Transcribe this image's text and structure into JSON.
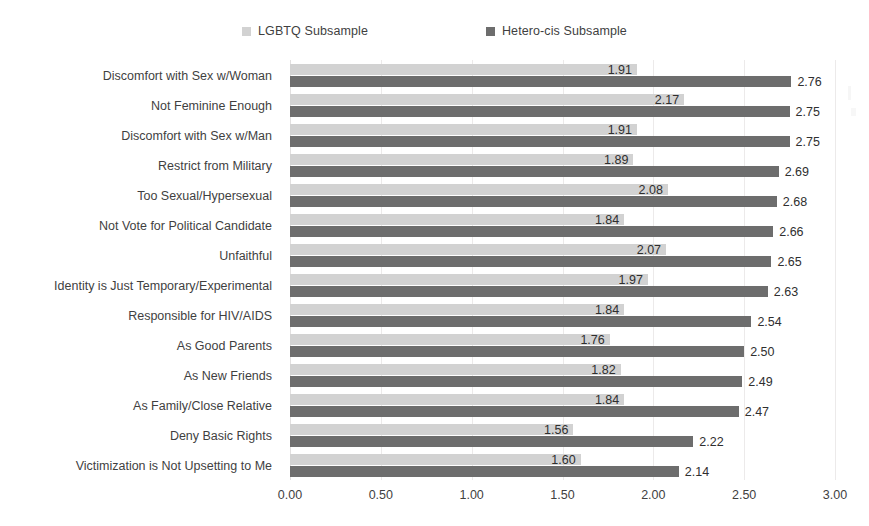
{
  "chart_data": {
    "type": "bar",
    "orientation": "horizontal",
    "title": "",
    "subtitle": "",
    "xlabel": "",
    "ylabel": "",
    "xlim": [
      0.0,
      3.0
    ],
    "xticks": [
      "0.00",
      "0.50",
      "1.00",
      "1.50",
      "2.00",
      "2.50",
      "3.00"
    ],
    "xtick_values": [
      0.0,
      0.5,
      1.0,
      1.5,
      2.0,
      2.5,
      3.0
    ],
    "grid": true,
    "grid_axis": "x",
    "legend_position": "top-center",
    "categories": [
      "Discomfort with Sex w/Woman",
      "Not Feminine Enough",
      "Discomfort with Sex w/Man",
      "Restrict from Military",
      "Too Sexual/Hypersexual",
      "Not Vote for Political Candidate",
      "Unfaithful",
      "Identity is Just Temporary/Experimental",
      "Responsible for HIV/AIDS",
      "As Good Parents",
      "As New Friends",
      "As Family/Close Relative",
      "Deny Basic Rights",
      "Victimization is Not Upsetting to Me"
    ],
    "series": [
      {
        "name": "LGBTQ Subsample",
        "color": "#d2d2d2",
        "values": [
          1.91,
          2.17,
          1.91,
          1.89,
          2.08,
          1.84,
          2.07,
          1.97,
          1.84,
          1.76,
          1.82,
          1.84,
          1.56,
          1.6
        ],
        "labels": [
          "1.91",
          "2.17",
          "1.91",
          "1.89",
          "2.08",
          "1.84",
          "2.07",
          "1.97",
          "1.84",
          "1.76",
          "1.82",
          "1.84",
          "1.56",
          "1.60"
        ]
      },
      {
        "name": "Hetero-cis Subsample",
        "color": "#6d6d6d",
        "values": [
          2.76,
          2.75,
          2.75,
          2.69,
          2.68,
          2.66,
          2.65,
          2.63,
          2.54,
          2.5,
          2.49,
          2.47,
          2.22,
          2.14
        ],
        "labels": [
          "2.76",
          "2.75",
          "2.75",
          "2.69",
          "2.68",
          "2.66",
          "2.65",
          "2.63",
          "2.54",
          "2.50",
          "2.49",
          "2.47",
          "2.22",
          "2.14"
        ]
      }
    ]
  },
  "legend": {
    "items": [
      {
        "label": "LGBTQ Subsample",
        "color": "#d2d2d2"
      },
      {
        "label": "Hetero-cis Subsample",
        "color": "#6d6d6d"
      }
    ]
  }
}
